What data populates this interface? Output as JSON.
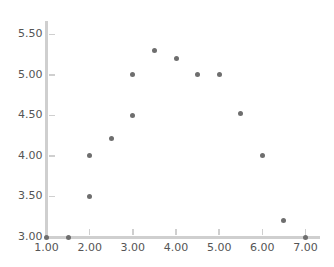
{
  "chart_data": {
    "type": "scatter",
    "title": "",
    "xlabel": "",
    "ylabel": "",
    "xlim": [
      1.0,
      7.0
    ],
    "ylim": [
      3.0,
      5.5
    ],
    "grid": false,
    "legend": null,
    "marker_color": "#6e6e6e",
    "axis_color": "#cfcfcf",
    "tick_label_color": "#555555",
    "background_color": "#ffffff",
    "xticks": [
      1.0,
      2.0,
      3.0,
      4.0,
      5.0,
      6.0,
      7.0
    ],
    "xtick_labels": [
      "1.00",
      "2.00",
      "3.00",
      "4.00",
      "5.00",
      "6.00",
      "7.00"
    ],
    "yticks": [
      3.0,
      3.5,
      4.0,
      4.5,
      5.0,
      5.5
    ],
    "ytick_labels": [
      "3.00",
      "3.50",
      "4.00",
      "4.50",
      "5.00",
      "5.50"
    ],
    "x": [
      1.0,
      1.5,
      2.0,
      2.0,
      2.5,
      3.0,
      3.0,
      3.5,
      4.0,
      4.5,
      5.0,
      5.5,
      6.0,
      6.5,
      7.0
    ],
    "y": [
      3.0,
      3.0,
      3.5,
      4.0,
      4.21,
      4.5,
      5.0,
      5.3,
      5.2,
      5.0,
      5.0,
      4.52,
      4.0,
      3.2,
      3.0
    ],
    "points": [
      {
        "x": 1.0,
        "y": 3.0
      },
      {
        "x": 1.5,
        "y": 3.0
      },
      {
        "x": 2.0,
        "y": 3.5
      },
      {
        "x": 2.0,
        "y": 4.0
      },
      {
        "x": 2.5,
        "y": 4.21
      },
      {
        "x": 3.0,
        "y": 4.5
      },
      {
        "x": 3.0,
        "y": 5.0
      },
      {
        "x": 3.5,
        "y": 5.3
      },
      {
        "x": 4.0,
        "y": 5.2
      },
      {
        "x": 4.5,
        "y": 5.0
      },
      {
        "x": 5.0,
        "y": 5.0
      },
      {
        "x": 5.5,
        "y": 4.52
      },
      {
        "x": 6.0,
        "y": 4.0
      },
      {
        "x": 6.5,
        "y": 3.2
      },
      {
        "x": 7.0,
        "y": 3.0
      }
    ]
  }
}
